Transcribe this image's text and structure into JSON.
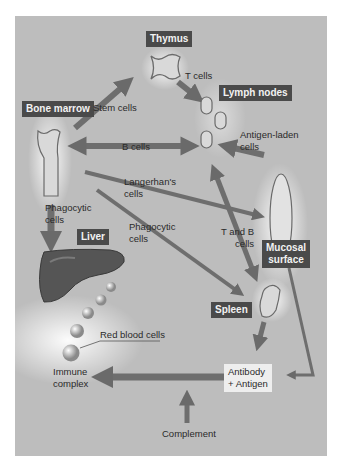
{
  "organs": {
    "thymus": "Thymus",
    "lymph_nodes": "Lymph nodes",
    "bone_marrow": "Bone marrow",
    "liver": "Liver",
    "mucosal_surface_line1": "Mucosal",
    "mucosal_surface_line2": "surface",
    "spleen": "Spleen"
  },
  "flows": {
    "t_cells": "T cells",
    "stem_cells": "Stem cells",
    "b_cells": "B cells",
    "antigen_laden_line1": "Antigen-laden",
    "antigen_laden_line2": "cells",
    "langerhans_line1": "Langerhan's",
    "langerhans_line2": "cells",
    "phagocytic_left_line1": "Phagocytic",
    "phagocytic_left_line2": "cells",
    "phagocytic_mid_line1": "Phagocytic",
    "phagocytic_mid_line2": "cells",
    "t_and_b_line1": "T and B",
    "t_and_b_line2": "cells",
    "red_blood_cells": "Red blood cells",
    "immune_complex_line1": "Immune",
    "immune_complex_line2": "complex",
    "antibody_antigen_line1": "Antibody",
    "antibody_antigen_line2": "+ Antigen",
    "complement": "Complement"
  },
  "colors": {
    "background": "#bdbdbd",
    "label_box": "#4a4a4a",
    "arrow": "#6e6e6e",
    "organ_fill": "#d9d9d9",
    "liver_fill": "#555555"
  }
}
